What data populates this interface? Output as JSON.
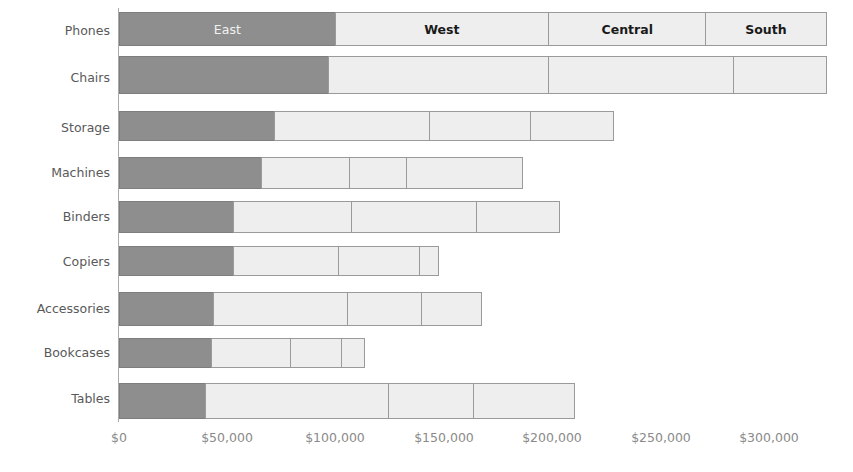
{
  "chart_data": {
    "type": "bar",
    "subtype": "stacked-horizontal",
    "title": "",
    "xlabel": "",
    "ylabel": "",
    "orientation": "horizontal",
    "stacked": true,
    "grid": false,
    "legend_position": "in-bars-first-row",
    "axis_prefix": "$",
    "xlim": [
      0,
      320000
    ],
    "xticks": [
      {
        "value": 0,
        "label": "$0",
        "px": 119
      },
      {
        "value": 50000,
        "label": "$50,000",
        "px": 227
      },
      {
        "value": 100000,
        "label": "$100,000",
        "px": 335
      },
      {
        "value": 150000,
        "label": "$150,000",
        "px": 444
      },
      {
        "value": 200000,
        "label": "$200,000",
        "px": 552
      },
      {
        "value": 250000,
        "label": "$250,000",
        "px": 661
      },
      {
        "value": 300000,
        "label": "$300,000",
        "px": 769
      }
    ],
    "categories": [
      "Phones",
      "Chairs",
      "Storage",
      "Machines",
      "Binders",
      "Copiers",
      "Accessories",
      "Bookcases",
      "Tables"
    ],
    "series": [
      {
        "name": "East",
        "color": "#8e8e8e",
        "values": [
          100000,
          97000,
          72000,
          66000,
          53000,
          53000,
          44000,
          43000,
          40000
        ]
      },
      {
        "name": "West",
        "color": "#eeeeee",
        "values": [
          99000,
          102000,
          72000,
          41000,
          55000,
          49000,
          62000,
          37000,
          85000
        ]
      },
      {
        "name": "Central",
        "color": "#eeeeee",
        "values": [
          73000,
          86000,
          47000,
          27000,
          58000,
          38000,
          35000,
          24000,
          40000
        ]
      },
      {
        "name": "South",
        "color": "#eeeeee",
        "values": [
          56000,
          43000,
          39000,
          54000,
          39000,
          9000,
          28000,
          11000,
          47000
        ]
      }
    ],
    "totals": [
      328000,
      328000,
      230000,
      188000,
      205000,
      149000,
      169000,
      115000,
      212000
    ],
    "bar_labels_first_row": [
      "East",
      "West",
      "Central",
      "South"
    ]
  },
  "axis": {
    "tick_color": "#8a8a8a",
    "label_color": "#595959",
    "axis_line_color": "#aaaaaa"
  },
  "colors": {
    "east_fill": "#8e8e8e",
    "other_fill": "#eeeeee",
    "segment_border": "#9a9a9a",
    "background": "#ffffff"
  }
}
